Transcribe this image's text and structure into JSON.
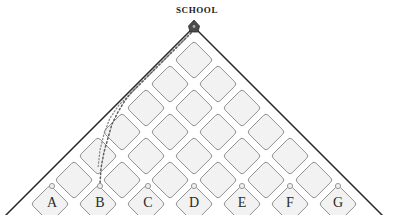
{
  "map": {
    "title": "SCHOOL",
    "title_x": 194,
    "title_y": 5,
    "apex": {
      "x": 194,
      "y": 27,
      "marker": "school-pin-marker"
    },
    "shape": "triangle",
    "background_color": "#ffffff",
    "outline_color": "#2b2b2b",
    "block_fill": "#f2f2f2",
    "block_stroke": "#8c8c8c",
    "node_dot_color": "#a8a8a8",
    "route_color": "#6e6e6e",
    "label_color": "#2a2a2a",
    "columns": [
      {
        "id": "A",
        "label": "A",
        "x": 52,
        "dot_y": 186,
        "label_y": 196
      },
      {
        "id": "B",
        "label": "B",
        "x": 100,
        "dot_y": 186,
        "label_y": 196
      },
      {
        "id": "C",
        "label": "C",
        "x": 148,
        "dot_y": 186,
        "label_y": 196
      },
      {
        "id": "D",
        "label": "D",
        "x": 194,
        "dot_y": 186,
        "label_y": 196
      },
      {
        "id": "E",
        "label": "E",
        "x": 242,
        "dot_y": 186,
        "label_y": 196
      },
      {
        "id": "F",
        "label": "F",
        "x": 290,
        "dot_y": 186,
        "label_y": 196
      },
      {
        "id": "G",
        "label": "G",
        "x": 338,
        "dot_y": 186,
        "label_y": 196
      }
    ],
    "blocks": [
      {
        "cx": 194,
        "cy": 60,
        "size": 19
      },
      {
        "cx": 170,
        "cy": 84,
        "size": 19
      },
      {
        "cx": 218,
        "cy": 84,
        "size": 19
      },
      {
        "cx": 146,
        "cy": 108,
        "size": 19
      },
      {
        "cx": 194,
        "cy": 108,
        "size": 19
      },
      {
        "cx": 242,
        "cy": 108,
        "size": 19
      },
      {
        "cx": 122,
        "cy": 132,
        "size": 19
      },
      {
        "cx": 170,
        "cy": 132,
        "size": 19
      },
      {
        "cx": 218,
        "cy": 132,
        "size": 19
      },
      {
        "cx": 266,
        "cy": 132,
        "size": 19
      },
      {
        "cx": 98,
        "cy": 156,
        "size": 19
      },
      {
        "cx": 146,
        "cy": 156,
        "size": 19
      },
      {
        "cx": 194,
        "cy": 156,
        "size": 19
      },
      {
        "cx": 242,
        "cy": 156,
        "size": 19
      },
      {
        "cx": 290,
        "cy": 156,
        "size": 19
      },
      {
        "cx": 74,
        "cy": 180,
        "size": 19
      },
      {
        "cx": 122,
        "cy": 180,
        "size": 19
      },
      {
        "cx": 170,
        "cy": 180,
        "size": 19
      },
      {
        "cx": 218,
        "cy": 180,
        "size": 19
      },
      {
        "cx": 266,
        "cy": 180,
        "size": 19
      },
      {
        "cx": 314,
        "cy": 180,
        "size": 19
      },
      {
        "cx": 50,
        "cy": 204,
        "size": 19
      },
      {
        "cx": 98,
        "cy": 204,
        "size": 19
      },
      {
        "cx": 146,
        "cy": 204,
        "size": 19
      },
      {
        "cx": 194,
        "cy": 204,
        "size": 19
      },
      {
        "cx": 242,
        "cy": 204,
        "size": 19
      },
      {
        "cx": 290,
        "cy": 204,
        "size": 19
      },
      {
        "cx": 338,
        "cy": 204,
        "size": 19
      }
    ],
    "route": {
      "name": "dotted-route-school-to-b",
      "style": "dotted",
      "points": "194,30 186,38 178,46 170,54 162,62 154,70 146,78 138,86 130,94 124,102 118,112 112,124 108,138 104,152 101,168 100,184"
    },
    "route_secondary": {
      "name": "dotted-route-edge-branch",
      "style": "dotted",
      "points": "191,33 182,42 173,51 164,60 155,69 146,78 137,87 128,96 119,105 110,118 104,134 100,150 98,168"
    }
  }
}
